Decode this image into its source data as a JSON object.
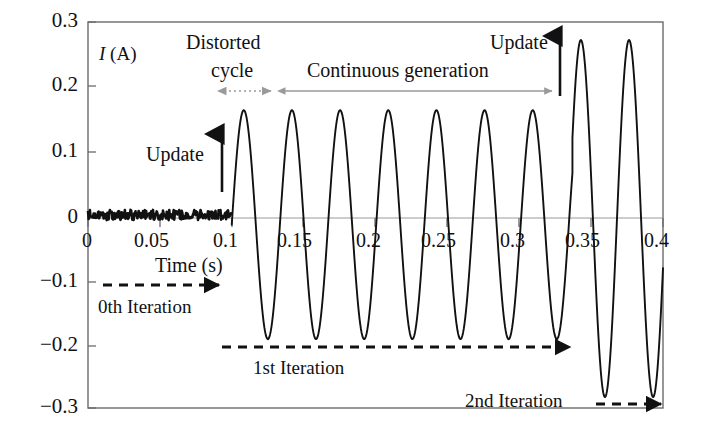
{
  "chart_data": {
    "type": "line",
    "title": "",
    "xlabel": "Time (s)",
    "ylabel": "I (A)",
    "ylabel_symbol": "I",
    "ylabel_unit": "(A)",
    "xlim": [
      0,
      0.4
    ],
    "ylim": [
      -0.3,
      0.3
    ],
    "grid": false,
    "legend": "none",
    "xticks": [
      0,
      0.05,
      0.1,
      0.15,
      0.2,
      0.25,
      0.3,
      0.35,
      0.4
    ],
    "xtick_labels": [
      "0",
      "0.05",
      "0.1",
      "0.15",
      "0.2",
      "0.25",
      "0.3",
      "0.35",
      "0.4"
    ],
    "yticks": [
      0.3,
      0.2,
      0.1,
      0,
      -0.1,
      -0.2,
      -0.3
    ],
    "ytick_labels": [
      "0.3",
      "0.2",
      "0.1",
      "0",
      "−0.1",
      "−0.2",
      "−0.3"
    ],
    "series": [
      {
        "name": "Current waveform",
        "color": "#111111",
        "description": "Noisy near-zero signal until t=0.1 s, then sinusoidal oscillation of amplitude ~0.17 A until t=0.337 s, then larger oscillation of amplitude ~0.275 A",
        "segments": [
          {
            "phase": "idle-noise",
            "t_start": 0.0,
            "t_end": 0.1,
            "mean": 0.0,
            "noise_amplitude": 0.008
          },
          {
            "phase": "oscillation-1",
            "t_start": 0.1,
            "t_end": 0.337,
            "peak": 0.163,
            "trough": -0.193,
            "period": 0.0335
          },
          {
            "phase": "oscillation-2",
            "t_start": 0.337,
            "t_end": 0.4,
            "peak": 0.272,
            "trough": -0.283,
            "period": 0.0335
          }
        ]
      }
    ],
    "annotations": [
      {
        "id": "update-1",
        "text": "Update",
        "type": "vertical-arrow",
        "t": 0.1,
        "y_from": 0.02,
        "y_to": 0.14
      },
      {
        "id": "update-2",
        "text": "Update",
        "type": "vertical-arrow",
        "t": 0.337,
        "y_from": 0.19,
        "y_to": 0.29
      },
      {
        "id": "distorted-cycle",
        "text": "Distorted cycle",
        "type": "double-arrow-dotted",
        "t_start": 0.1,
        "t_end": 0.137,
        "color": "#9a9a9a"
      },
      {
        "id": "continuous-generation",
        "text": "Continuous generation",
        "type": "double-arrow",
        "t_start": 0.137,
        "t_end": 0.327,
        "color": "#9a9a9a"
      },
      {
        "id": "iteration-0",
        "text": "0th Iteration",
        "type": "dashed-arrow",
        "t_start": 0.01,
        "t_end": 0.094,
        "y": -0.105
      },
      {
        "id": "iteration-1",
        "text": "1st Iteration",
        "type": "dashed-arrow",
        "t_start": 0.094,
        "t_end": 0.338,
        "y": -0.196
      },
      {
        "id": "iteration-2",
        "text": "2nd Iteration",
        "type": "dashed-arrow",
        "t_start": 0.353,
        "t_end": 0.4,
        "y": -0.283
      }
    ]
  },
  "labels": {
    "y_axis": {
      "symbol": "I",
      "unit": "(A)"
    },
    "x_axis": "Time (s)",
    "update_1": "Update",
    "update_2": "Update",
    "distorted_line1": "Distorted",
    "distorted_line2": "cycle",
    "continuous": "Continuous generation",
    "iteration_0": "0th Iteration",
    "iteration_1": "1st Iteration",
    "iteration_2": "2nd Iteration"
  },
  "colors": {
    "trace": "#111111",
    "frame": "#6b6b6b",
    "zero_line": "#9a9a9a",
    "annotation_gray": "#9a9a9a",
    "text": "#111111",
    "background": "#ffffff"
  }
}
